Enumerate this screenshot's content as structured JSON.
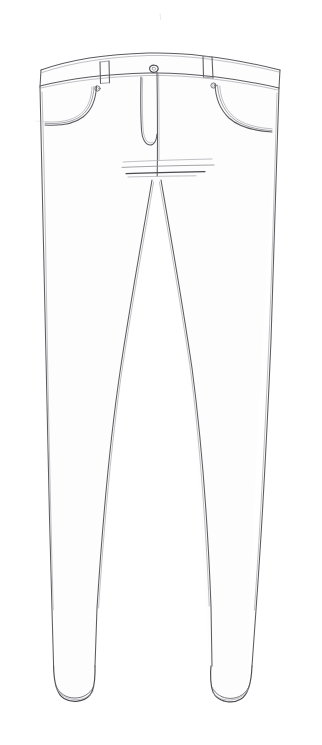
{
  "document": {
    "kind": "pencil technical sketch",
    "subject": "jeans front view",
    "title": "",
    "caption": "",
    "paper_color": "#ffffff",
    "ink_color": "#5b5b60",
    "width_px": 322,
    "height_px": 745
  },
  "garment": {
    "view": "front",
    "type": "skinny-tapered jeans",
    "parts": [
      {
        "name": "waistband",
        "label": ""
      },
      {
        "name": "belt-loop-left",
        "label": ""
      },
      {
        "name": "belt-loop-right",
        "label": ""
      },
      {
        "name": "waist-button",
        "label": ""
      },
      {
        "name": "fly-curve",
        "label": ""
      },
      {
        "name": "center-front-seam",
        "label": ""
      },
      {
        "name": "pocket-left",
        "label": ""
      },
      {
        "name": "pocket-right",
        "label": ""
      },
      {
        "name": "rivet-left",
        "label": ""
      },
      {
        "name": "rivet-right",
        "label": ""
      },
      {
        "name": "crotch-lines",
        "label": ""
      },
      {
        "name": "leg-left",
        "label": ""
      },
      {
        "name": "leg-right",
        "label": ""
      },
      {
        "name": "inseam-left",
        "label": ""
      },
      {
        "name": "inseam-right",
        "label": ""
      },
      {
        "name": "hem-left",
        "label": ""
      },
      {
        "name": "hem-right",
        "label": ""
      }
    ]
  },
  "annotations": {
    "notes": [],
    "measurements": []
  }
}
